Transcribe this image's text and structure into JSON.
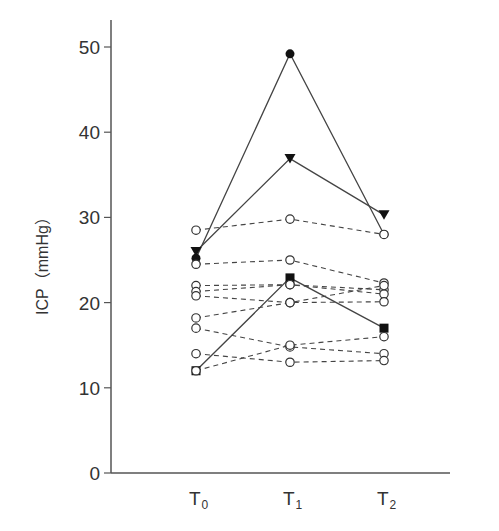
{
  "chart_data": {
    "type": "line",
    "title": "",
    "xlabel": "",
    "ylabel": "ICP（mmHg）",
    "ylim": [
      0,
      50
    ],
    "yticks": [
      0,
      10,
      20,
      30,
      40,
      50
    ],
    "categories": [
      "T0",
      "T1",
      "T2"
    ],
    "category_labels": [
      {
        "main": "T",
        "sub": "0"
      },
      {
        "main": "T",
        "sub": "1"
      },
      {
        "main": "T",
        "sub": "2"
      }
    ],
    "grid": false,
    "legend": null,
    "series": [
      {
        "name": "patient-filled-circle",
        "marker": "filled-circle",
        "line": "solid",
        "values": [
          25.2,
          49.2,
          28.0
        ]
      },
      {
        "name": "patient-filled-triangle",
        "marker": "filled-triangle-down",
        "line": "solid",
        "values": [
          26.0,
          36.9,
          30.3
        ]
      },
      {
        "name": "patient-filled-square",
        "marker": "filled-square",
        "line": "solid",
        "values": [
          12.0,
          22.9,
          17.0
        ]
      },
      {
        "name": "patient-open-1",
        "marker": "open-circle",
        "line": "dashed",
        "values": [
          28.5,
          29.8,
          28.0
        ]
      },
      {
        "name": "patient-open-2",
        "marker": "open-circle",
        "line": "dashed",
        "values": [
          24.5,
          25.0,
          22.3
        ]
      },
      {
        "name": "patient-open-3",
        "marker": "open-circle",
        "line": "dashed",
        "values": [
          22.0,
          22.1,
          21.5
        ]
      },
      {
        "name": "patient-open-4",
        "marker": "open-circle",
        "line": "dashed",
        "values": [
          21.3,
          22.1,
          21.0
        ]
      },
      {
        "name": "patient-open-5",
        "marker": "open-circle",
        "line": "dashed",
        "values": [
          20.8,
          20.0,
          22.0
        ]
      },
      {
        "name": "patient-open-6",
        "marker": "open-circle",
        "line": "dashed",
        "values": [
          18.2,
          20.0,
          20.1
        ]
      },
      {
        "name": "patient-open-7",
        "marker": "open-circle",
        "line": "dashed",
        "values": [
          17.0,
          14.8,
          14.0
        ]
      },
      {
        "name": "patient-open-8",
        "marker": "open-circle",
        "line": "dashed",
        "values": [
          14.0,
          13.0,
          13.2
        ]
      },
      {
        "name": "patient-open-9",
        "marker": "open-circle",
        "line": "dashed",
        "values": [
          12.0,
          15.0,
          16.0
        ]
      }
    ]
  }
}
